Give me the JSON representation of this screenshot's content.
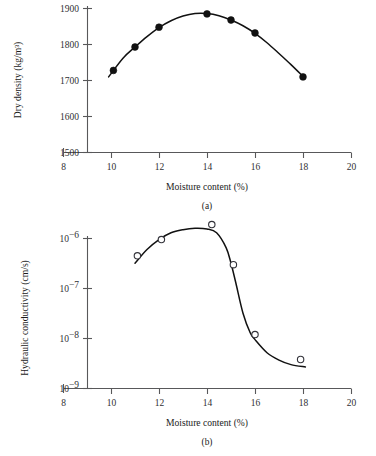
{
  "figure": {
    "panels": [
      {
        "caption": "(a)",
        "xlabel": "Moisture content (%)",
        "ylabel": "Dry density (kg/m³)"
      },
      {
        "caption": "(b)",
        "xlabel": "Moisture content (%)",
        "ylabel": "Hydraulic conductivity (cm/s)"
      }
    ]
  },
  "chart_data": [
    {
      "type": "scatter",
      "panel": "(a)",
      "title": "",
      "xlabel": "Moisture content (%)",
      "ylabel": "Dry density (kg/m³)",
      "xlim": [
        8,
        20
      ],
      "ylim": [
        1500,
        1900
      ],
      "xticks": [
        8,
        10,
        12,
        14,
        16,
        18,
        20
      ],
      "xticklabels": [
        "8",
        "10",
        "12",
        "14",
        "16",
        "18",
        "20"
      ],
      "yticks": [
        1500,
        1600,
        1700,
        1800,
        1900
      ],
      "yticklabels": [
        "1500",
        "1600",
        "1700",
        "1800",
        "1900"
      ],
      "yscale": "linear",
      "grid": false,
      "legend": "none",
      "marker": "filled-circle",
      "x": [
        10.1,
        11.0,
        12.0,
        14.0,
        15.0,
        16.0,
        18.0
      ],
      "y": [
        1728,
        1793,
        1848,
        1885,
        1868,
        1832,
        1710
      ],
      "fit_curve": {
        "label": "compaction curve",
        "x": [
          9.9,
          10.5,
          11.0,
          11.5,
          12.0,
          12.5,
          13.0,
          13.5,
          14.0,
          14.5,
          15.0,
          15.5,
          16.0,
          16.5,
          17.0,
          17.5,
          18.05
        ],
        "y": [
          1710,
          1762,
          1793,
          1822,
          1847,
          1866,
          1879,
          1886,
          1886,
          1880,
          1868,
          1852,
          1831,
          1805,
          1775,
          1744,
          1708
        ]
      }
    },
    {
      "type": "scatter",
      "panel": "(b)",
      "title": "",
      "xlabel": "Moisture content (%)",
      "ylabel": "Hydraulic conductivity (cm/s)",
      "xlim": [
        8,
        20
      ],
      "ylim": [
        1e-09,
        1e-06
      ],
      "xticks": [
        8,
        10,
        12,
        14,
        16,
        18,
        20
      ],
      "xticklabels": [
        "8",
        "10",
        "12",
        "14",
        "16",
        "18",
        "20"
      ],
      "yticks": [
        1e-09,
        1e-08,
        1e-07,
        1e-06
      ],
      "yticklabels": [
        "10–9",
        "10–8",
        "10–7",
        "10–6"
      ],
      "ytick_bases": [
        "10",
        "10",
        "10",
        "10"
      ],
      "ytick_exponents": [
        "−9",
        "−8",
        "−7",
        "−6"
      ],
      "yscale": "log",
      "grid": false,
      "legend": "none",
      "marker": "open-circle",
      "x": [
        11.1,
        12.1,
        14.2,
        15.1,
        16.0,
        17.9
      ],
      "y": [
        4.5e-07,
        9.5e-07,
        1.9e-06,
        3e-07,
        1.2e-08,
        3.8e-09
      ],
      "fit_curve": {
        "label": "hydraulic conductivity curve",
        "x": [
          11.0,
          11.5,
          12.0,
          12.5,
          13.0,
          13.5,
          14.0,
          14.4,
          14.8,
          15.0,
          15.2,
          15.5,
          15.8,
          16.0,
          16.5,
          17.0,
          17.5,
          18.1
        ],
        "y": [
          3.2e-07,
          6e-07,
          9.5e-07,
          1.3e-06,
          1.5e-06,
          1.6e-06,
          1.55e-06,
          1.3e-06,
          6.5e-07,
          3.2e-07,
          1.3e-07,
          3.2e-08,
          1.3e-08,
          9.5e-09,
          5.2e-09,
          3.7e-09,
          3e-09,
          2.7e-09
        ]
      }
    }
  ]
}
